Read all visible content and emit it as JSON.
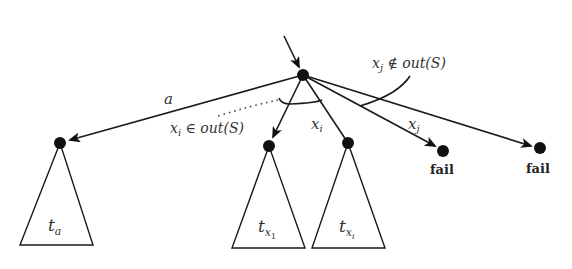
{
  "diagram": {
    "type": "tree",
    "nodes": [
      {
        "id": "root",
        "x": 303,
        "y": 75
      },
      {
        "id": "a",
        "x": 60,
        "y": 143
      },
      {
        "id": "x1",
        "x": 269,
        "y": 146
      },
      {
        "id": "xi",
        "x": 348,
        "y": 143
      },
      {
        "id": "fail1",
        "x": 443,
        "y": 151
      },
      {
        "id": "fail2",
        "x": 540,
        "y": 148
      }
    ],
    "edges": [
      {
        "from": "root",
        "to": "a",
        "label": "a"
      },
      {
        "from": "root",
        "to": "x1",
        "label": ""
      },
      {
        "from": "root",
        "to": "xi",
        "label": "x_i"
      },
      {
        "from": "root",
        "to": "fail1",
        "label": "x_j"
      },
      {
        "from": "root",
        "to": "fail2",
        "label": ""
      }
    ],
    "labels": {
      "edge_a": "a",
      "edge_xi_base": "x",
      "edge_xi_sub": "i",
      "edge_xj_base": "x",
      "edge_xj_sub": "j",
      "in_out_base": "x",
      "in_out_sub": "i",
      "in_out_rest": " ∈ out(S)",
      "notin_out_base": "x",
      "notin_out_sub": "j",
      "notin_out_rest": " ∉ out(S)",
      "fail_1": "fail",
      "fail_2": "fail"
    },
    "subtrees": [
      {
        "id": "ta",
        "base": "t",
        "sub": "a"
      },
      {
        "id": "tx1",
        "base": "t",
        "sub": "x",
        "subsub": "1"
      },
      {
        "id": "txi",
        "base": "t",
        "sub": "x",
        "subsub": "i"
      }
    ]
  }
}
